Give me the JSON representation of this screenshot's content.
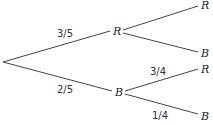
{
  "diagram": {
    "type": "probability-tree",
    "root": {
      "x": 3,
      "y": 62
    },
    "level1": [
      {
        "label": "R",
        "probability": "3/5"
      },
      {
        "label": "B",
        "probability": "2/5"
      }
    ],
    "level2": {
      "from_R": [
        {
          "label": "R",
          "probability": ""
        },
        {
          "label": "B",
          "probability": ""
        }
      ],
      "from_B": [
        {
          "label": "R",
          "probability": "3/4"
        },
        {
          "label": "B",
          "probability": "1/4"
        }
      ]
    }
  }
}
